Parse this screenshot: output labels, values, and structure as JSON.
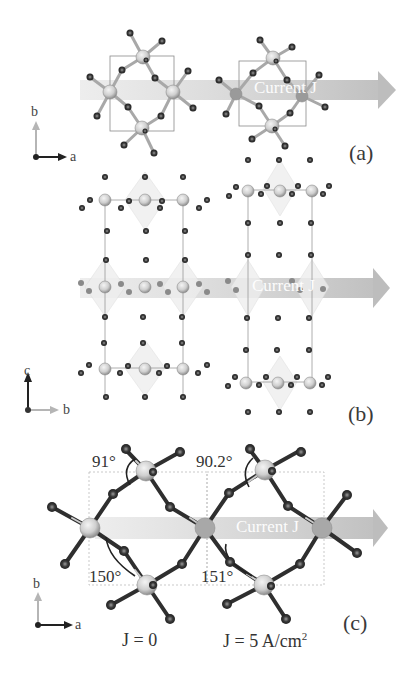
{
  "figure": {
    "colors": {
      "current_arrow": "#c8c8c8",
      "big_atom_fill": "#d6d6d6",
      "big_atom_stroke": "#8e8e8e",
      "small_atom_fill": "#2a2a2a",
      "small_atom_core": "#777777",
      "bond": "#b0b0b0",
      "cell_box": "#8a8a8a",
      "axis_dark": "#222222",
      "axis_light": "#b5b5b5"
    },
    "current_label": "Current J",
    "panels": [
      {
        "id": "a",
        "label": "(a)",
        "view": "ab-plane",
        "axes": {
          "horizontal": "a",
          "vertical": "b"
        }
      },
      {
        "id": "b",
        "label": "(b)",
        "view": "bc-plane",
        "axes": {
          "horizontal": "b",
          "vertical": "c"
        }
      },
      {
        "id": "c",
        "label": "(c)",
        "view": "ab-plane-magnified",
        "axes": {
          "horizontal": "a",
          "vertical": "b"
        },
        "angles": {
          "left_top": "91°",
          "left_bottom": "150°",
          "right_top": "90.2°",
          "right_bottom": "151°"
        },
        "conditions": {
          "left": "J = 0",
          "right_prefix": "J = 5 A/cm",
          "right_sup": "2"
        }
      }
    ]
  }
}
